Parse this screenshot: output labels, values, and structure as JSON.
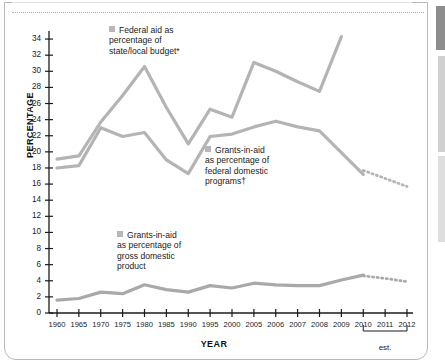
{
  "chart_data": {
    "type": "line",
    "title": "",
    "xlabel": "YEAR",
    "ylabel": "PERCENTAGE",
    "ylim": [
      0,
      35
    ],
    "yticks": [
      0,
      2,
      4,
      6,
      8,
      10,
      12,
      14,
      16,
      18,
      20,
      22,
      24,
      26,
      28,
      30,
      32,
      34
    ],
    "categories": [
      "1960",
      "1965",
      "1970",
      "1975",
      "1980",
      "1985",
      "1990",
      "1995",
      "2000",
      "2005",
      "2006",
      "2007",
      "2008",
      "2009",
      "2010",
      "2011",
      "2012"
    ],
    "grid": false,
    "legend_position": "inline-annotations",
    "estimate_note": "est.",
    "estimate_span": [
      "2010",
      "2012"
    ],
    "series": [
      {
        "name": "Federal aid as percentage of state/local budget*",
        "color": "#b4b4b4",
        "x": [
          "1960",
          "1965",
          "1970",
          "1975",
          "1980",
          "1985",
          "1990",
          "1995",
          "2000",
          "2005",
          "2006",
          "2007",
          "2008",
          "2009"
        ],
        "values": [
          19.1,
          19.5,
          23.7,
          27.0,
          30.6,
          25.5,
          21.0,
          25.3,
          24.3,
          31.1,
          30.0,
          28.7,
          27.5,
          34.3
        ],
        "estimated_x": [],
        "estimated_values": []
      },
      {
        "name": "Grants-in-aid as percentage of federal domestic programs†",
        "color": "#b4b4b4",
        "x": [
          "1960",
          "1965",
          "1970",
          "1975",
          "1980",
          "1985",
          "1990",
          "1995",
          "2000",
          "2005",
          "2006",
          "2007",
          "2008",
          "2009",
          "2010"
        ],
        "values": [
          18.0,
          18.3,
          23.0,
          21.9,
          22.4,
          19.0,
          17.3,
          21.9,
          22.2,
          23.1,
          23.8,
          23.1,
          22.6,
          19.9,
          17.2
        ],
        "estimated_x": [
          "2010",
          "2011",
          "2012"
        ],
        "estimated_values": [
          17.7,
          16.7,
          15.7
        ]
      },
      {
        "name": "Grants-in-aid as percentage of gross domestic product",
        "color": "#a9a9a9",
        "x": [
          "1960",
          "1965",
          "1970",
          "1975",
          "1980",
          "1985",
          "1990",
          "1995",
          "2000",
          "2005",
          "2006",
          "2007",
          "2008",
          "2009",
          "2010"
        ],
        "values": [
          1.6,
          1.8,
          2.6,
          2.4,
          3.5,
          2.9,
          2.6,
          3.4,
          3.1,
          3.7,
          3.5,
          3.4,
          3.4,
          4.1,
          4.7
        ],
        "estimated_x": [
          "2010",
          "2011",
          "2012"
        ],
        "estimated_values": [
          4.6,
          4.3,
          3.9
        ]
      }
    ]
  },
  "axis": {
    "y_title": "PERCENTAGE",
    "x_title": "YEAR"
  },
  "legends": {
    "federal": {
      "line1": "Federal aid as",
      "line2": "percentage of",
      "line3": "state/local budget*"
    },
    "domestic": {
      "line1": "Grants-in-aid",
      "line2": "as percentage of",
      "line3": "federal domestic",
      "line4": "programs†"
    },
    "gdp": {
      "line1": "Grants-in-aid",
      "line2": "as percentage of",
      "line3": "gross domestic",
      "line4": "product"
    }
  },
  "annotations": {
    "estimate": "est."
  }
}
